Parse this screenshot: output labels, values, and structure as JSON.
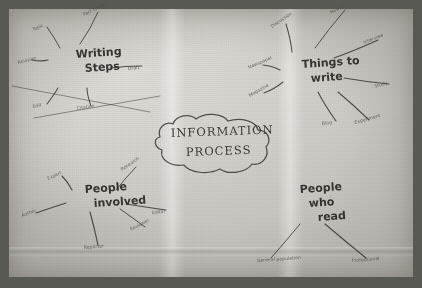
{
  "artifact": {
    "medium": "hand-drawn mind map on paper, photographed",
    "center": {
      "line1": "INFORMATION",
      "line2": "PROCESS"
    }
  },
  "clusters": [
    {
      "id": "writing-steps",
      "hub_line1": "Writing",
      "hub_line2": "Steps",
      "hub_x": 76,
      "hub_y": 58,
      "leaves": [
        {
          "label": "Topic",
          "x": 33,
          "y": 31,
          "rot": -22,
          "ex": 60,
          "ey": 48
        },
        {
          "label": "Fact check",
          "x": 84,
          "y": 16,
          "rot": -26,
          "ex": 80,
          "ey": 44
        },
        {
          "label": "Revision",
          "x": 18,
          "y": 64,
          "rot": -14,
          "ex": 48,
          "ey": 60
        },
        {
          "label": "Draft",
          "x": 128,
          "y": 70,
          "rot": -5,
          "ex": 110,
          "ey": 68
        },
        {
          "label": "Edit",
          "x": 33,
          "y": 108,
          "rot": -12,
          "ex": 58,
          "ey": 88
        },
        {
          "label": "Citation",
          "x": 77,
          "y": 110,
          "rot": -10,
          "ex": 87,
          "ey": 88
        }
      ]
    },
    {
      "id": "things-to-write",
      "hub_line1": "Things to",
      "hub_line2": "write",
      "hub_x": 302,
      "hub_y": 68,
      "leaves": [
        {
          "label": "Discussion",
          "x": 272,
          "y": 28,
          "rot": -34,
          "ex": 292,
          "ey": 52
        },
        {
          "label": "How to",
          "x": 331,
          "y": 14,
          "rot": -28,
          "ex": 315,
          "ey": 48
        },
        {
          "label": "Interview",
          "x": 364,
          "y": 44,
          "rot": -22,
          "ex": 334,
          "ey": 58
        },
        {
          "label": "Newspaper",
          "x": 249,
          "y": 69,
          "rot": -24,
          "ex": 280,
          "ey": 70
        },
        {
          "label": "Study",
          "x": 375,
          "y": 88,
          "rot": -18,
          "ex": 344,
          "ey": 78
        },
        {
          "label": "Magazine",
          "x": 250,
          "y": 97,
          "rot": -30,
          "ex": 283,
          "ey": 82
        },
        {
          "label": "Blog",
          "x": 322,
          "y": 125,
          "rot": -8,
          "ex": 318,
          "ey": 92
        },
        {
          "label": "Experiment",
          "x": 355,
          "y": 124,
          "rot": -16,
          "ex": 338,
          "ey": 92
        }
      ]
    },
    {
      "id": "people-involved",
      "hub_line1": "People",
      "hub_line2": "involved",
      "hub_x": 85,
      "hub_y": 193,
      "leaves": [
        {
          "label": "Expert",
          "x": 48,
          "y": 180,
          "rot": -24,
          "ex": 72,
          "ey": 190
        },
        {
          "label": "Research",
          "x": 122,
          "y": 171,
          "rot": -34,
          "ex": 116,
          "ey": 190
        },
        {
          "label": "Author",
          "x": 22,
          "y": 217,
          "rot": -20,
          "ex": 66,
          "ey": 203
        },
        {
          "label": "Editor",
          "x": 152,
          "y": 214,
          "rot": -6,
          "ex": 126,
          "ey": 204
        },
        {
          "label": "Reviewer",
          "x": 131,
          "y": 231,
          "rot": -28,
          "ex": 120,
          "ey": 209
        },
        {
          "label": "Reporter",
          "x": 84,
          "y": 249,
          "rot": -5,
          "ex": 90,
          "ey": 212
        }
      ]
    },
    {
      "id": "people-who-read",
      "hub_line1": "People",
      "hub_line2": "who",
      "hub_line3": "read",
      "hub_x": 300,
      "hub_y": 193,
      "leaves": [
        {
          "label": "General population",
          "x": 257,
          "y": 262,
          "rot": -4,
          "ex": 300,
          "ey": 224
        },
        {
          "label": "Professional",
          "x": 352,
          "y": 262,
          "rot": -4,
          "ex": 325,
          "ey": 224
        }
      ]
    }
  ]
}
